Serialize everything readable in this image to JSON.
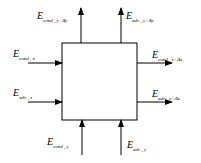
{
  "diagram": {
    "title": "",
    "box": {
      "x": 62,
      "y": 43,
      "w": 75,
      "h": 77
    },
    "labels": {
      "cond_top": {
        "main": "E",
        "sub": "cond , y+Δy"
      },
      "adv_top": {
        "main": "E",
        "sub": "adv , y+Δy"
      },
      "cond_left": {
        "main": "E",
        "sub": "cond , x"
      },
      "adv_left": {
        "main": "E",
        "sub": "adv , x"
      },
      "cond_right": {
        "main": "E",
        "sub": "cond , x+Δx"
      },
      "adv_right": {
        "main": "E",
        "sub": "adv , x+Δx"
      },
      "cond_bottom": {
        "main": "E",
        "sub": "cond , y"
      },
      "adv_bottom": {
        "main": "E",
        "sub": "adv , y"
      }
    },
    "arrows": [
      {
        "name": "cond-top-arrow",
        "dir": "up"
      },
      {
        "name": "adv-top-arrow",
        "dir": "up"
      },
      {
        "name": "cond-left-arrow",
        "dir": "right"
      },
      {
        "name": "adv-left-arrow",
        "dir": "right"
      },
      {
        "name": "cond-right-arrow",
        "dir": "right"
      },
      {
        "name": "adv-right-arrow",
        "dir": "right"
      },
      {
        "name": "cond-bottom-arrow",
        "dir": "up"
      },
      {
        "name": "adv-bottom-arrow",
        "dir": "up"
      }
    ]
  }
}
